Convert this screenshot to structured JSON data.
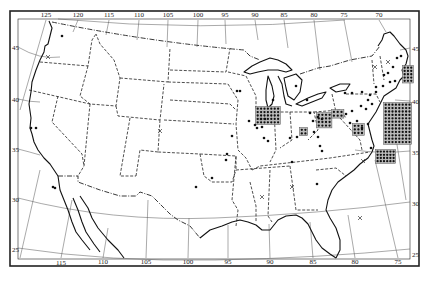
{
  "map": {
    "title": "",
    "frame": {
      "outer": [
        10,
        11,
        419,
        266
      ],
      "inner": [
        18,
        19,
        410,
        259
      ]
    },
    "longitude_labels_top": [
      {
        "label": "125",
        "x": 46,
        "y": 17
      },
      {
        "label": "120",
        "x": 78,
        "y": 17
      },
      {
        "label": "115",
        "x": 109,
        "y": 17
      },
      {
        "label": "110",
        "x": 139,
        "y": 17
      },
      {
        "label": "105",
        "x": 168,
        "y": 17
      },
      {
        "label": "100",
        "x": 198,
        "y": 17
      },
      {
        "label": "95",
        "x": 225,
        "y": 17
      },
      {
        "label": "90",
        "x": 255,
        "y": 17
      },
      {
        "label": "85",
        "x": 284,
        "y": 17
      },
      {
        "label": "80",
        "x": 314,
        "y": 17
      },
      {
        "label": "75",
        "x": 344,
        "y": 17
      },
      {
        "label": "70",
        "x": 379,
        "y": 17
      }
    ],
    "longitude_labels_bottom": [
      {
        "label": "115",
        "x": 61,
        "y": 265
      },
      {
        "label": "110",
        "x": 103,
        "y": 264
      },
      {
        "label": "105",
        "x": 146,
        "y": 264
      },
      {
        "label": "100",
        "x": 188,
        "y": 264
      },
      {
        "label": "95",
        "x": 228,
        "y": 264
      },
      {
        "label": "90",
        "x": 270,
        "y": 264
      },
      {
        "label": "85",
        "x": 313,
        "y": 264
      },
      {
        "label": "80",
        "x": 355,
        "y": 264
      },
      {
        "label": "75",
        "x": 398,
        "y": 264
      }
    ],
    "latitude_labels_left": [
      {
        "label": "45",
        "x": 12,
        "y": 50
      },
      {
        "label": "40",
        "x": 12,
        "y": 102
      },
      {
        "label": "35",
        "x": 12,
        "y": 152
      },
      {
        "label": "30",
        "x": 12,
        "y": 202
      },
      {
        "label": "25",
        "x": 12,
        "y": 252
      }
    ],
    "latitude_labels_right": [
      {
        "label": "45",
        "x": 412,
        "y": 51
      },
      {
        "label": "40",
        "x": 412,
        "y": 104
      },
      {
        "label": "35",
        "x": 412,
        "y": 155
      },
      {
        "label": "30",
        "x": 412,
        "y": 206
      },
      {
        "label": "25",
        "x": 412,
        "y": 257
      }
    ],
    "legend": null
  },
  "markers": {
    "dots": [
      [
        62,
        36
      ],
      [
        31,
        128
      ],
      [
        36,
        128
      ],
      [
        53,
        187
      ],
      [
        55,
        188
      ],
      [
        237,
        91
      ],
      [
        240,
        91
      ],
      [
        249,
        121
      ],
      [
        232,
        136
      ],
      [
        227,
        154
      ],
      [
        226,
        160
      ],
      [
        196,
        187
      ],
      [
        212,
        178
      ],
      [
        273,
        100
      ],
      [
        296,
        86
      ],
      [
        255,
        125
      ],
      [
        261,
        119
      ],
      [
        265,
        119
      ],
      [
        262,
        127
      ],
      [
        257,
        128
      ],
      [
        264,
        138
      ],
      [
        268,
        141
      ],
      [
        290,
        138
      ],
      [
        297,
        137
      ],
      [
        307,
        100
      ],
      [
        310,
        113
      ],
      [
        313,
        121
      ],
      [
        318,
        117
      ],
      [
        322,
        119
      ],
      [
        314,
        132
      ],
      [
        318,
        137
      ],
      [
        357,
        121
      ],
      [
        350,
        123
      ],
      [
        362,
        128
      ],
      [
        368,
        124
      ],
      [
        346,
        114
      ],
      [
        352,
        111
      ],
      [
        361,
        106
      ],
      [
        366,
        109
      ],
      [
        320,
        146
      ],
      [
        322,
        151
      ],
      [
        292,
        162
      ],
      [
        317,
        184
      ],
      [
        371,
        148
      ],
      [
        345,
        93
      ],
      [
        352,
        93
      ],
      [
        362,
        92
      ],
      [
        376,
        87
      ],
      [
        383,
        86
      ],
      [
        376,
        92
      ],
      [
        370,
        95
      ],
      [
        372,
        104
      ],
      [
        368,
        100
      ],
      [
        384,
        75
      ],
      [
        388,
        73
      ],
      [
        393,
        67
      ],
      [
        397,
        58
      ],
      [
        401,
        56
      ],
      [
        395,
        81
      ],
      [
        390,
        82
      ]
    ],
    "crosses": [
      [
        48,
        57
      ],
      [
        160,
        131
      ],
      [
        363,
        161
      ],
      [
        292,
        187
      ],
      [
        262,
        197
      ],
      [
        360,
        218
      ],
      [
        375,
        67
      ],
      [
        388,
        62
      ]
    ],
    "dot_grids": [
      {
        "name": "illinois-grid",
        "x": 256,
        "y": 107,
        "cols": 7,
        "rows": 5,
        "spacing": 3.4
      },
      {
        "name": "ohio-grid",
        "x": 317,
        "y": 113,
        "cols": 4,
        "rows": 4,
        "spacing": 3.6
      },
      {
        "name": "pennsylvania-west-grid",
        "x": 332,
        "y": 110,
        "cols": 3,
        "rows": 2,
        "spacing": 3.8
      },
      {
        "name": "indiana-grid",
        "x": 300,
        "y": 128,
        "cols": 2,
        "rows": 2,
        "spacing": 3.6
      },
      {
        "name": "maryland-grid",
        "x": 353,
        "y": 124,
        "cols": 3,
        "rows": 3,
        "spacing": 3.6
      },
      {
        "name": "massachusetts-grid",
        "x": 403,
        "y": 66,
        "cols": 3,
        "rows": 5,
        "spacing": 3.3
      },
      {
        "name": "new-york-city-grid",
        "x": 384,
        "y": 103,
        "cols": 8,
        "rows": 12,
        "spacing": 3.4
      },
      {
        "name": "virginia-grid",
        "x": 376,
        "y": 150,
        "cols": 6,
        "rows": 4,
        "spacing": 3.2
      }
    ]
  }
}
